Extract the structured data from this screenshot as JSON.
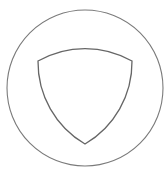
{
  "diagram": {
    "type": "geometric-figure",
    "background": "#ffffff",
    "stroke_color": "#7a7a7a",
    "inner_stroke_color": "#666666",
    "outer_circle": {
      "cx": 85,
      "cy": 88,
      "r": 78
    },
    "inner_shape": {
      "name": "reuleaux-triangle",
      "vertices": [
        [
          38,
          61
        ],
        [
          132,
          61
        ],
        [
          85,
          144
        ]
      ]
    }
  }
}
